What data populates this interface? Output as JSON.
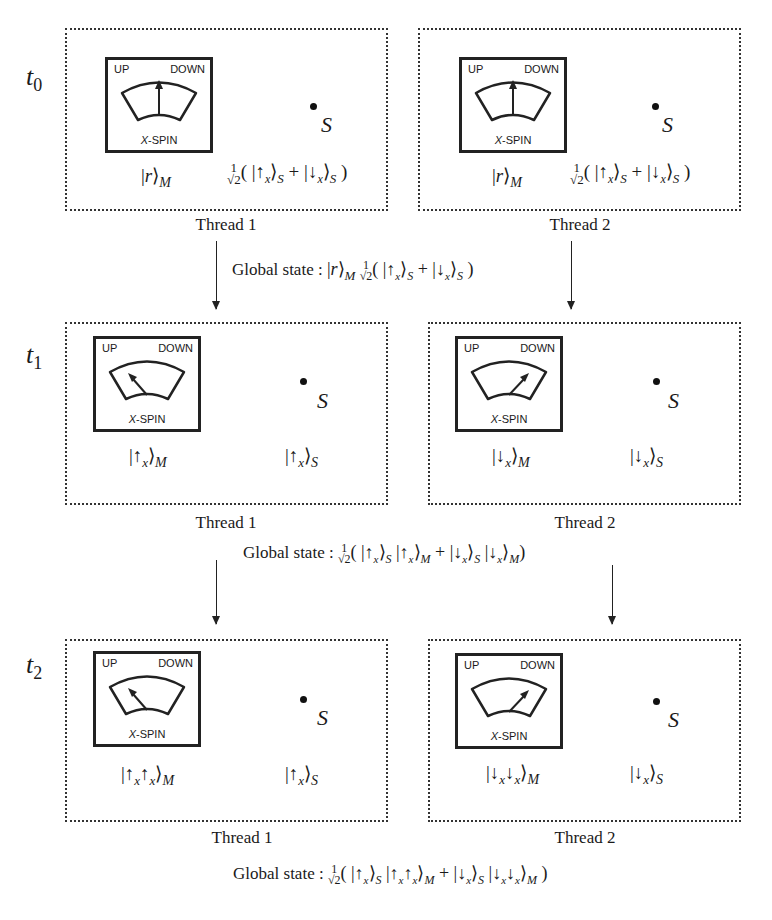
{
  "rows": [
    {
      "time_symbol": "t",
      "time_index": "0",
      "panels": [
        {
          "thread_label": "Thread 1",
          "pointer": "center",
          "meter": {
            "up": "UP",
            "down": "DOWN",
            "axis_italic": "X",
            "axis_rest": "-SPIN"
          },
          "system_label": "S",
          "meter_state": "|r⟩_M",
          "system_state": "1/√2(|↑x⟩_S + |↓x⟩_S)"
        },
        {
          "thread_label": "Thread 2",
          "pointer": "center",
          "meter": {
            "up": "UP",
            "down": "DOWN",
            "axis_italic": "X",
            "axis_rest": "-SPIN"
          },
          "system_label": "S",
          "meter_state": "|r⟩_M",
          "system_state": "1/√2(|↑x⟩_S + |↓x⟩_S)"
        }
      ],
      "global_state_label": "Global state :",
      "global_state": "|r⟩_M 1/√2(|↑x⟩_S + |↓x⟩_S)"
    },
    {
      "time_symbol": "t",
      "time_index": "1",
      "panels": [
        {
          "thread_label": "Thread 1",
          "pointer": "up",
          "meter": {
            "up": "UP",
            "down": "DOWN",
            "axis_italic": "X",
            "axis_rest": "-SPIN"
          },
          "system_label": "S",
          "meter_state": "|↑x⟩_M",
          "system_state": "|↑x⟩_S"
        },
        {
          "thread_label": "Thread 2",
          "pointer": "down",
          "meter": {
            "up": "UP",
            "down": "DOWN",
            "axis_italic": "X",
            "axis_rest": "-SPIN"
          },
          "system_label": "S",
          "meter_state": "|↓x⟩_M",
          "system_state": "|↓x⟩_S"
        }
      ],
      "global_state_label": "Global state :",
      "global_state": "1/√2(|↑x⟩_S |↑x⟩_M + |↓x⟩_S |↓x⟩_M)"
    },
    {
      "time_symbol": "t",
      "time_index": "2",
      "panels": [
        {
          "thread_label": "Thread 1",
          "pointer": "up",
          "meter": {
            "up": "UP",
            "down": "DOWN",
            "axis_italic": "X",
            "axis_rest": "-SPIN"
          },
          "system_label": "S",
          "meter_state": "|↑x↑x⟩_M",
          "system_state": "|↑x⟩_S"
        },
        {
          "thread_label": "Thread 2",
          "pointer": "down",
          "meter": {
            "up": "UP",
            "down": "DOWN",
            "axis_italic": "X",
            "axis_rest": "-SPIN"
          },
          "system_label": "S",
          "meter_state": "|↓x↓x⟩_M",
          "system_state": "|↓x⟩_S"
        }
      ],
      "global_state_label": "Global state :",
      "global_state": "1/√2(|↑x⟩_S |↑x↑x⟩_M + |↓x⟩_S |↓x↓x⟩_M)"
    }
  ],
  "math": {
    "frac_num": "1",
    "frac_den": "√2",
    "open_paren": "(",
    "close_paren": ")",
    "plus": "+",
    "bar": "|",
    "rangle": "⟩",
    "up_arrow": "↑",
    "down_arrow": "↓",
    "x": "x",
    "r": "r",
    "M": "M",
    "S": "S"
  }
}
